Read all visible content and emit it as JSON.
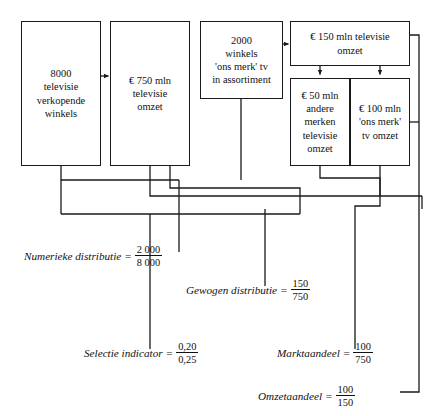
{
  "diagram": {
    "language": "nl",
    "background_color": "#ffffff",
    "line_color": "#1a1a1a",
    "text_color": "#111111"
  },
  "boxes": [
    {
      "id": "winkels_totaal",
      "text": "8000\ntelevisie\nverkopende\nwinkels",
      "x": 21,
      "y": 21,
      "w": 80,
      "h": 145
    },
    {
      "id": "omzet_totaal",
      "text": "€ 750 mln\ntelevisie\nomzet",
      "x": 110,
      "y": 21,
      "w": 80,
      "h": 145
    },
    {
      "id": "winkels_ons_merk",
      "text": "2000\nwinkels\n'ons merk' tv\nin assortiment",
      "x": 200,
      "y": 21,
      "w": 83,
      "h": 78
    },
    {
      "id": "omzet_selectie",
      "text": "€ 150 mln televisie\nomzet",
      "x": 290,
      "y": 21,
      "w": 120,
      "h": 45
    },
    {
      "id": "omzet_andere_merken",
      "text": "€ 50 mln\nandere\nmerken\ntelevisie\nomzet",
      "x": 290,
      "y": 78,
      "w": 60,
      "h": 88
    },
    {
      "id": "omzet_ons_merk",
      "text": "€ 100 mln\n'ons merk'\ntv omzet",
      "x": 350,
      "y": 78,
      "w": 60,
      "h": 88
    }
  ],
  "formulas": [
    {
      "id": "numerieke_distributie",
      "label": "Numerieke distributie",
      "equals": "=",
      "numerator": "2 000",
      "denominator": "8 000",
      "x": 24,
      "y": 244
    },
    {
      "id": "gewogen_distributie",
      "label": "Gewogen distributie",
      "equals": "=",
      "numerator": "150",
      "denominator": "750",
      "x": 186,
      "y": 278
    },
    {
      "id": "selectie_indicator",
      "label": "Selectie indicator",
      "equals": "=",
      "numerator": "0,20",
      "denominator": "0,25",
      "x": 84,
      "y": 341
    },
    {
      "id": "marktaandeel",
      "label": "Marktaandeel",
      "equals": "=",
      "numerator": "100",
      "denominator": "750",
      "x": 277,
      "y": 341
    },
    {
      "id": "omzetaandeel",
      "label": "Omzetaandeel",
      "equals": "=",
      "numerator": "100",
      "denominator": "150",
      "x": 258,
      "y": 384
    }
  ]
}
